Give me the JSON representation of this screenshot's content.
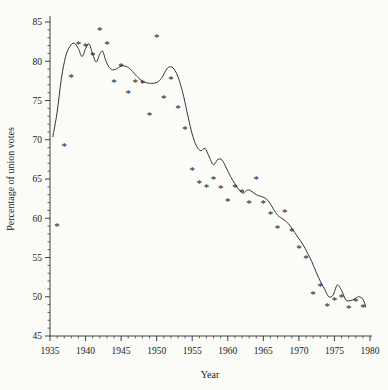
{
  "figure": {
    "background_color": "#fbfbf8",
    "ink_color": "#2b2b2b",
    "marker_glyph": "*"
  },
  "chart_data": {
    "type": "scatter",
    "title": "",
    "xlabel": "Year",
    "ylabel": "Percentage of union votes",
    "xlim": [
      1935,
      1980
    ],
    "ylim": [
      45,
      85
    ],
    "grid": false,
    "legend": null,
    "x_major_ticks": [
      1935,
      1940,
      1945,
      1950,
      1955,
      1960,
      1965,
      1970,
      1975,
      1980
    ],
    "x_tick_labels": [
      "1935",
      "1940",
      "1945",
      "1950",
      "1955",
      "1960",
      "1965",
      "1970",
      "1975",
      "1980"
    ],
    "x_minor_tick_step": 1,
    "y_major_ticks": [
      45,
      50,
      55,
      60,
      65,
      70,
      75,
      80,
      85
    ],
    "y_tick_labels": [
      "45",
      "50",
      "55",
      "60",
      "65",
      "70",
      "75",
      "80",
      "85"
    ],
    "y_minor_tick_step": 1,
    "series": [
      {
        "name": "Percentage of union votes",
        "type": "scatter",
        "marker": "star",
        "x": [
          1936,
          1937,
          1938,
          1939,
          1940,
          1941,
          1942,
          1943,
          1944,
          1945,
          1946,
          1947,
          1948,
          1949,
          1950,
          1951,
          1952,
          1953,
          1954,
          1955,
          1956,
          1957,
          1958,
          1959,
          1960,
          1961,
          1962,
          1963,
          1964,
          1965,
          1966,
          1967,
          1968,
          1969,
          1970,
          1971,
          1972,
          1973,
          1974,
          1975,
          1976,
          1977,
          1978,
          1979
        ],
        "y": [
          59.0,
          69.2,
          78.0,
          82.2,
          82.0,
          80.8,
          84.0,
          82.2,
          77.4,
          79.4,
          76.0,
          77.3,
          77.2,
          73.2,
          83.1,
          75.3,
          77.8,
          74.0,
          71.4,
          66.2,
          64.5,
          64.0,
          65.0,
          63.8,
          62.2,
          64.0,
          63.3,
          62.0,
          65.0,
          62.0,
          60.5,
          58.8,
          60.8,
          58.4,
          56.2,
          55.0,
          50.4,
          51.4,
          48.8,
          49.6,
          50.0,
          48.6,
          49.4,
          48.7
        ]
      },
      {
        "name": "smoothed trend",
        "type": "line",
        "x": [
          1935.4,
          1936.0,
          1936.6,
          1937.2,
          1937.8,
          1938.4,
          1939.0,
          1939.5,
          1940.0,
          1940.5,
          1941.0,
          1941.5,
          1942.0,
          1942.4,
          1942.8,
          1943.2,
          1943.6,
          1944.0,
          1944.5,
          1945.0,
          1945.5,
          1946.0,
          1946.6,
          1947.2,
          1947.8,
          1948.4,
          1949.0,
          1949.6,
          1950.2,
          1950.8,
          1951.4,
          1952.0,
          1952.6,
          1953.2,
          1953.8,
          1954.4,
          1955.0,
          1955.6,
          1956.2,
          1956.8,
          1957.4,
          1958.0,
          1958.6,
          1959.2,
          1959.8,
          1960.4,
          1961.0,
          1961.6,
          1962.2,
          1962.8,
          1963.4,
          1964.0,
          1964.6,
          1965.2,
          1965.8,
          1966.4,
          1967.0,
          1967.6,
          1968.2,
          1968.8,
          1969.4,
          1970.0,
          1970.6,
          1971.2,
          1971.8,
          1972.4,
          1973.0,
          1973.6,
          1974.2,
          1974.8,
          1975.4,
          1976.0,
          1976.6,
          1977.2,
          1977.8,
          1978.4,
          1979.0,
          1979.4
        ],
        "y": [
          70.4,
          73.5,
          77.8,
          80.6,
          81.9,
          82.3,
          81.6,
          80.6,
          81.6,
          82.2,
          80.9,
          79.9,
          80.9,
          81.3,
          80.2,
          79.4,
          79.0,
          78.9,
          79.1,
          79.4,
          79.4,
          79.2,
          78.7,
          78.1,
          77.6,
          77.3,
          77.2,
          77.2,
          77.4,
          78.0,
          79.0,
          79.3,
          78.8,
          77.5,
          75.5,
          73.0,
          70.7,
          69.2,
          68.6,
          68.9,
          67.8,
          66.8,
          67.5,
          67.4,
          66.4,
          65.3,
          64.4,
          63.6,
          63.2,
          63.6,
          63.4,
          63.0,
          62.8,
          62.6,
          62.1,
          61.2,
          60.4,
          60.0,
          59.6,
          59.0,
          58.2,
          57.4,
          56.6,
          55.6,
          54.5,
          53.2,
          52.0,
          51.0,
          50.0,
          50.2,
          51.5,
          50.8,
          49.6,
          49.5,
          49.7,
          50.0,
          49.7,
          48.7
        ]
      }
    ]
  }
}
